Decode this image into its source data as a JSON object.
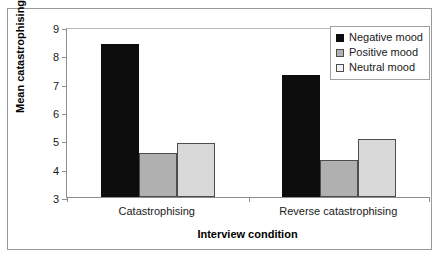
{
  "chart_data": {
    "type": "bar",
    "title": "",
    "xlabel": "Interview condition",
    "ylabel": "Mean catastrophising steps",
    "categories": [
      "Catastrophising",
      "Reverse catastrophising"
    ],
    "series": [
      {
        "name": "Negative mood",
        "color": "#0d0d0d",
        "values": [
          8.4,
          7.3
        ]
      },
      {
        "name": "Positive mood",
        "color": "#b0b0b0",
        "values": [
          4.55,
          4.3
        ]
      },
      {
        "name": "Neutral mood",
        "color": "#d9d9d9",
        "values": [
          4.9,
          5.05
        ]
      }
    ],
    "ylim": [
      3,
      9
    ],
    "yticks": [
      3,
      4,
      5,
      6,
      7,
      8,
      9
    ],
    "ytick_labels": [
      "3",
      "4",
      "5",
      "6",
      "7",
      "8",
      "9"
    ],
    "grid": false,
    "legend_position": "top-right"
  }
}
